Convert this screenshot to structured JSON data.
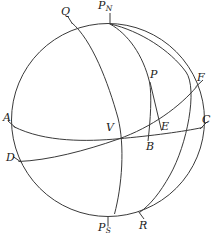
{
  "figure": {
    "type": "spherical-geometry-diagram",
    "width": 215,
    "height": 239,
    "background_color": "#ffffff",
    "stroke_color": "#3a3a3a",
    "label_color": "#1a1a1a"
  },
  "labels": {
    "q": "Q",
    "pn_main": "P",
    "pn_sub": "N",
    "p": "P",
    "f": "F",
    "a": "A",
    "c": "C",
    "e": "E",
    "v": "V",
    "b": "B",
    "d": "D",
    "ps_main": "P",
    "ps_sub": "S",
    "r": "R"
  },
  "geometry": {
    "sphere_outline": {
      "name": "limb-circle",
      "cx": 108,
      "cy": 120,
      "r": 97
    },
    "points": [
      {
        "id": "Q",
        "x": 72,
        "y": 22,
        "label_x": 62,
        "label_y": 7
      },
      {
        "id": "PN",
        "x": 110,
        "y": 24,
        "label_x": 99,
        "label_y": 1
      },
      {
        "id": "P",
        "x": 150,
        "y": 82,
        "label_x": 151,
        "label_y": 70
      },
      {
        "id": "F",
        "x": 197,
        "y": 86,
        "label_x": 198,
        "label_y": 73
      },
      {
        "id": "A",
        "x": 14,
        "y": 127,
        "label_x": 3,
        "label_y": 113
      },
      {
        "id": "C",
        "x": 202,
        "y": 128,
        "label_x": 202,
        "label_y": 115
      },
      {
        "id": "E",
        "x": 161,
        "y": 131,
        "label_x": 161,
        "label_y": 122
      },
      {
        "id": "V",
        "x": 118,
        "y": 139,
        "label_x": 107,
        "label_y": 123
      },
      {
        "id": "B",
        "x": 148,
        "y": 141,
        "label_x": 147,
        "label_y": 142
      },
      {
        "id": "D",
        "x": 19,
        "y": 161,
        "label_x": 7,
        "label_y": 153
      },
      {
        "id": "PS",
        "x": 108,
        "y": 217,
        "label_x": 99,
        "label_y": 223
      },
      {
        "id": "R",
        "x": 139,
        "y": 213,
        "label_x": 140,
        "label_y": 221
      }
    ],
    "arcs": [
      {
        "id": "equator",
        "name": "equator-arc",
        "from": "A",
        "through": "V",
        "to": "C"
      },
      {
        "id": "ecliptic",
        "name": "ecliptic-arc",
        "from": "D",
        "through": "V",
        "to": "F"
      },
      {
        "id": "meridian-pn-b",
        "name": "hour-circle-arc",
        "from": "PN",
        "through": "P",
        "to": "B"
      },
      {
        "id": "meridian-pn-e",
        "name": "colure-arc",
        "from": "PN",
        "through": "F",
        "to": "R"
      },
      {
        "id": "horizon-q-ps",
        "name": "horizon-arc",
        "from": "Q",
        "through": "V",
        "to": "PS"
      },
      {
        "id": "segment-p-e",
        "name": "declination-segment",
        "from": "P",
        "to": "E"
      },
      {
        "id": "segment-p-b",
        "name": "vertical-segment",
        "from": "P",
        "to": "B"
      }
    ],
    "tick_marks": [
      {
        "id": "tick-pn",
        "x1": 110,
        "y1": 13,
        "x2": 110,
        "y2": 24
      },
      {
        "id": "tick-ps",
        "x1": 108,
        "y1": 217,
        "x2": 108,
        "y2": 227
      },
      {
        "id": "tick-q",
        "x1": 68,
        "y1": 16,
        "x2": 73,
        "y2": 24
      },
      {
        "id": "tick-r",
        "x1": 144,
        "y1": 219,
        "x2": 138,
        "y2": 212
      },
      {
        "id": "tick-a",
        "x1": 8,
        "y1": 121,
        "x2": 16,
        "y2": 128
      },
      {
        "id": "tick-d",
        "x1": 13,
        "y1": 157,
        "x2": 21,
        "y2": 162
      },
      {
        "id": "tick-c",
        "x1": 207,
        "y1": 122,
        "x2": 200,
        "y2": 129
      },
      {
        "id": "tick-f",
        "x1": 203,
        "y1": 80,
        "x2": 196,
        "y2": 87
      }
    ]
  }
}
